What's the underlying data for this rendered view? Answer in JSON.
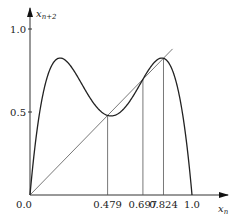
{
  "chart_data": {
    "type": "line",
    "title": "",
    "xlabel": "x_n",
    "ylabel": "x_{n+2}",
    "xlabel_main": "x",
    "xlabel_sub": "n",
    "ylabel_main": "x",
    "ylabel_sub": "n+2",
    "xlim": [
      0,
      1
    ],
    "ylim": [
      0,
      1
    ],
    "grid": false,
    "legend": null,
    "x_ticks": [
      "0.0",
      "0.479",
      "0.697",
      "0.824",
      "1.0"
    ],
    "x_tick_values": [
      0.0,
      0.479,
      0.697,
      0.824,
      1.0
    ],
    "y_ticks": [
      "0.5",
      "1.0"
    ],
    "y_tick_values": [
      0.5,
      1.0
    ],
    "origin_label": "0.0",
    "series": [
      {
        "name": "second iterate f(f(x)), f(x)=r x (1-x), r=3.3",
        "function": "f(f(x))",
        "r": 3.3,
        "x": [
          0.0,
          0.05,
          0.1,
          0.15,
          0.2,
          0.25,
          0.3,
          0.35,
          0.4,
          0.45,
          0.479,
          0.5,
          0.55,
          0.6,
          0.65,
          0.697,
          0.75,
          0.8,
          0.824,
          0.85,
          0.9,
          0.95,
          1.0
        ],
        "values": [
          0.0,
          0.483,
          0.796,
          0.809,
          0.811,
          0.825,
          0.744,
          0.617,
          0.511,
          0.476,
          0.479,
          0.508,
          0.609,
          0.743,
          0.824,
          0.697,
          0.813,
          0.807,
          0.824,
          0.674,
          0.787,
          0.493,
          0.0
        ]
      },
      {
        "name": "diagonal y = x",
        "x": [
          0.0,
          0.88
        ],
        "values": [
          0.0,
          0.88
        ]
      }
    ],
    "annotations": [
      {
        "type": "vertical-line",
        "x": 0.479,
        "to_y": 0.479
      },
      {
        "type": "vertical-line",
        "x": 0.697,
        "to_y": 0.697
      },
      {
        "type": "vertical-line",
        "x": 0.824,
        "to_y": 0.824
      }
    ]
  }
}
